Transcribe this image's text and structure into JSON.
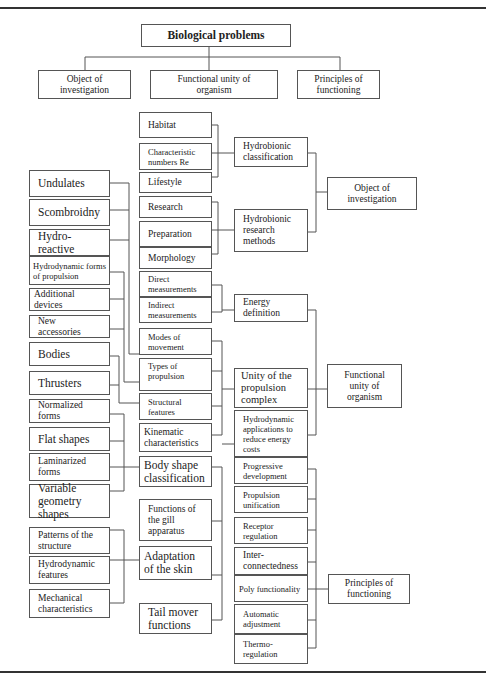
{
  "diagram": {
    "root": "Biological problems",
    "top_categories": [
      "Object of investigation",
      "Functional unity of organism",
      "Principles of functioning"
    ],
    "left_column": [
      "Undulates",
      "Scombroidny",
      "Hydro-reactive",
      "Hydrodynamic forms of propulsion",
      "Additional devices",
      "New accessories",
      "Bodies",
      "Thrusters",
      "Normalized forms",
      "Flat shapes",
      "Laminarized forms",
      "Variable geometry shapes",
      "Patterns of the structure",
      "Hydrodynamic features",
      "Mechanical characteristics"
    ],
    "middle_column": [
      "Habitat",
      "Characteristic numbers Re",
      "Lifestyle",
      "Research",
      "Preparation",
      "Morphology",
      "Direct measurements",
      "Indirect measurements",
      "Modes of movement",
      "Types of propulsion",
      "Structural features",
      "Kinematic characteristics",
      "Body shape classification",
      "Functions of the gill apparatus",
      "Adaptation of the skin",
      "Tail mover functions"
    ],
    "right_column": [
      "Hydrobionic classification",
      "Hydrobionic research methods",
      "Energy definition",
      "Unity of the propulsion complex",
      "Hydrodynamic applications to reduce energy costs",
      "Progressive development",
      "Propulsion unification",
      "Receptor regulation",
      "Inter-connectedness",
      "Poly functionality",
      "Automatic adjustment",
      "Thermo-regulation"
    ],
    "outcomes": [
      "Object of investigation",
      "Functional unity of organism",
      "Principles of functioning"
    ]
  }
}
